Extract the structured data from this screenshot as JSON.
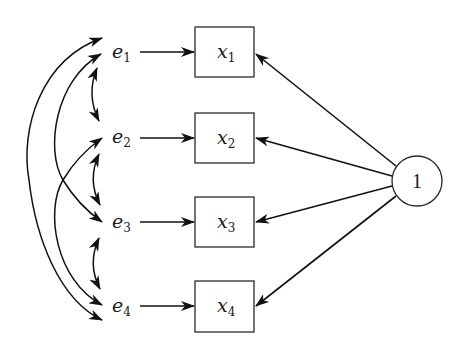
{
  "diagram": {
    "type": "path-diagram",
    "constant_node": {
      "label": "1"
    },
    "observed": [
      {
        "base": "x",
        "sub": "1"
      },
      {
        "base": "x",
        "sub": "2"
      },
      {
        "base": "x",
        "sub": "3"
      },
      {
        "base": "x",
        "sub": "4"
      }
    ],
    "errors": [
      {
        "base": "e",
        "sub": "1"
      },
      {
        "base": "e",
        "sub": "2"
      },
      {
        "base": "e",
        "sub": "3"
      },
      {
        "base": "e",
        "sub": "4"
      }
    ],
    "edges": {
      "directed": [
        {
          "from": "e1",
          "to": "x1"
        },
        {
          "from": "e2",
          "to": "x2"
        },
        {
          "from": "e3",
          "to": "x3"
        },
        {
          "from": "e4",
          "to": "x4"
        },
        {
          "from": "1",
          "to": "x1"
        },
        {
          "from": "1",
          "to": "x2"
        },
        {
          "from": "1",
          "to": "x3"
        },
        {
          "from": "1",
          "to": "x4"
        }
      ],
      "covariances": [
        {
          "between": [
            "e1",
            "e2"
          ]
        },
        {
          "between": [
            "e2",
            "e3"
          ]
        },
        {
          "between": [
            "e3",
            "e4"
          ]
        },
        {
          "between": [
            "e1",
            "e3"
          ]
        },
        {
          "between": [
            "e2",
            "e4"
          ]
        },
        {
          "between": [
            "e1",
            "e4"
          ]
        }
      ]
    },
    "colors": {
      "stroke": "#111111",
      "background": "#ffffff"
    }
  }
}
